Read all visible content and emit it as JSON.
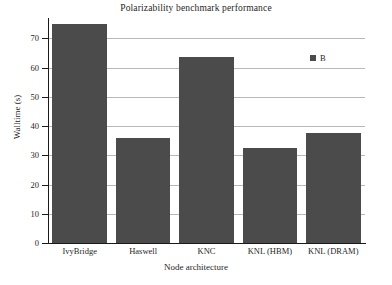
{
  "chart_data": {
    "type": "bar",
    "title": "Polarizability benchmark performance",
    "xlabel": "Node architecture",
    "ylabel": "Walltime (s)",
    "categories": [
      "IvyBridge",
      "Haswell",
      "KNC",
      "KNL (HBM)",
      "KNL (DRAM)"
    ],
    "values": [
      75.0,
      36.0,
      63.5,
      32.5,
      37.5
    ],
    "series": [
      {
        "name": "B",
        "values": [
          75.0,
          36.0,
          63.5,
          32.5,
          37.5
        ],
        "color": "#4b4b4b"
      }
    ],
    "ylim": [
      0,
      77
    ],
    "yticks": [
      0,
      10,
      20,
      30,
      40,
      50,
      60,
      70
    ],
    "ytick_labels": [
      "0",
      "10",
      "20",
      "30",
      "40",
      "50",
      "60",
      "70"
    ],
    "grid": "horizontal",
    "legend": {
      "position": "top-right",
      "entries": [
        {
          "label": "B",
          "color": "#4b4b4b"
        }
      ]
    },
    "colors": {
      "bar": "#4b4b4b",
      "gridline": "#b8b8b8",
      "axis": "#1a1a1a",
      "text": "#1f1f1f",
      "background": "#ffffff"
    }
  }
}
